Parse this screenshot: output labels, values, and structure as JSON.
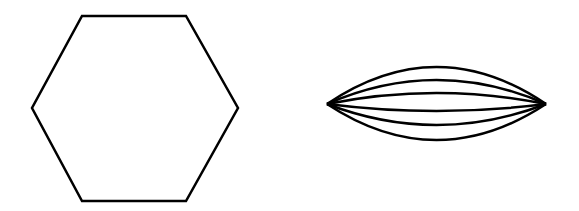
{
  "figure": {
    "background": "#ffffff",
    "stroke_color": "#000000",
    "shapes": [
      {
        "name": "hexagon",
        "type": "polygon",
        "points": [
          [
            82,
            16
          ],
          [
            186,
            16
          ],
          [
            238,
            108
          ],
          [
            186,
            201
          ],
          [
            82,
            201
          ],
          [
            32,
            108
          ]
        ]
      },
      {
        "name": "lens-of-arcs",
        "type": "arc-bundle",
        "left_tip": [
          327,
          104
        ],
        "right_tip": [
          546,
          104
        ],
        "curve_count": 6,
        "control_y": [
          30,
          56,
          82,
          118,
          146,
          176
        ]
      }
    ]
  }
}
